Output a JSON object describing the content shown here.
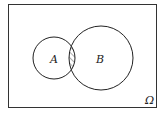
{
  "diagram": {
    "type": "venn",
    "universe_label": "Ω",
    "sets": [
      {
        "label": "A"
      },
      {
        "label": "B"
      }
    ],
    "shaded_region": "A ∩ B",
    "colors": {
      "stroke": "#222222",
      "background": "#ffffff"
    }
  }
}
